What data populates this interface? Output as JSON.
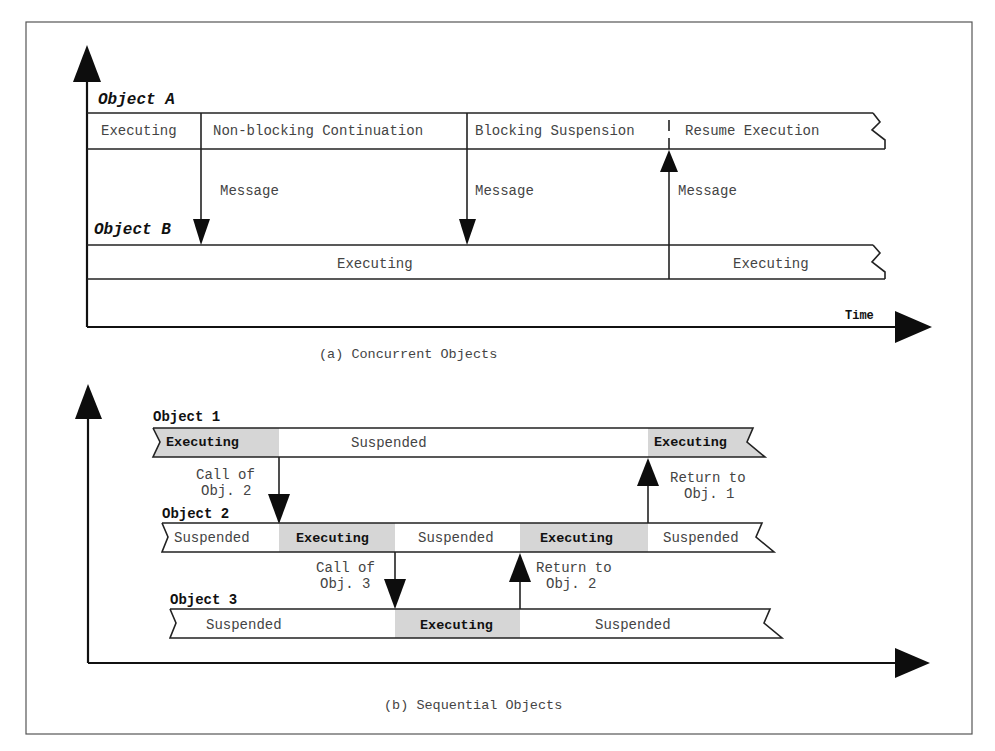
{
  "panel_a": {
    "object_a_label": "Object A",
    "object_b_label": "Object B",
    "object_a_segments": [
      "Executing",
      "Non-blocking Continuation",
      "Blocking Suspension",
      "Resume Execution"
    ],
    "object_b_segments": [
      "Executing",
      "Executing"
    ],
    "messages": [
      "Message",
      "Message",
      "Message"
    ],
    "time_label": "Time",
    "caption": "(a) Concurrent Objects"
  },
  "panel_b": {
    "object_1_label": "Object 1",
    "object_2_label": "Object 2",
    "object_3_label": "Object 3",
    "object_1_segments": [
      "Executing",
      "Suspended",
      "Executing"
    ],
    "object_2_segments": [
      "Suspended",
      "Executing",
      "Suspended",
      "Executing",
      "Suspended"
    ],
    "object_3_segments": [
      "Suspended",
      "Executing",
      "Suspended"
    ],
    "call_obj2": [
      "Call of",
      "Obj. 2"
    ],
    "call_obj3": [
      "Call of",
      "Obj. 3"
    ],
    "return_obj2": [
      "Return to",
      "Obj. 2"
    ],
    "return_obj1": [
      "Return to",
      "Obj. 1"
    ],
    "caption": "(b) Sequential Objects"
  },
  "colors": {
    "executing_shade": "#d6d6d6",
    "line": "#222222",
    "background": "#ffffff"
  }
}
